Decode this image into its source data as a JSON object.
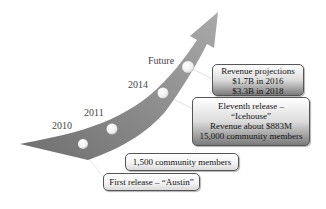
{
  "diagram": {
    "type": "timeline-growth-arrow",
    "milestones": [
      {
        "label": "2010"
      },
      {
        "label": "2011"
      },
      {
        "label": "2014"
      },
      {
        "label": "Future"
      }
    ],
    "callouts": {
      "revenue_projections": {
        "lines": [
          "Revenue projections",
          "$1.7B in 2016",
          "$3.3B in 2018"
        ]
      },
      "eleventh_release": {
        "lines": [
          "Eleventh release –",
          "“Icehouse”",
          "Revenue about $883M",
          "15,000 community members"
        ]
      },
      "community_1500": {
        "lines": [
          "1,500 community members"
        ]
      },
      "first_release": {
        "lines": [
          "First release – “Austin”"
        ]
      }
    },
    "colors": {
      "arrow": "#7f7f7f",
      "arrow_highlight": "#b5b5b5",
      "dot": "#f4f4f4",
      "box_border": "#555555"
    }
  }
}
